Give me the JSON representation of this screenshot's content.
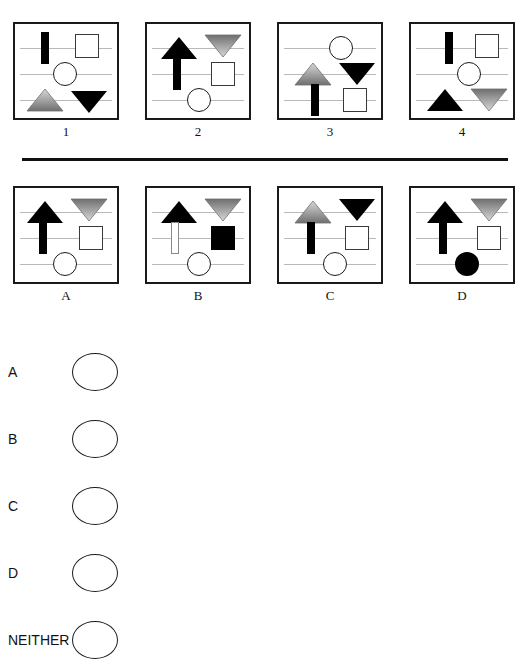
{
  "task": {
    "type": "visual-analogy-matrix",
    "divider_color": "#111111"
  },
  "palette": {
    "black": "#000000",
    "gray_light": "#d8d8d8",
    "gray_mid": "#9a9a9a",
    "gray_dark": "#6f6f6f",
    "rule_line": "#b9b9b9",
    "panel_border": "#1a1a1a",
    "background": "#ffffff"
  },
  "stimulus_row": {
    "panels": [
      {
        "label": "1",
        "shapes": [
          {
            "name": "bar-black",
            "kind": "bar",
            "fill": "black",
            "row": 1,
            "x": 30,
            "y": 24
          },
          {
            "name": "square-hollow",
            "kind": "square",
            "fill": "hollow",
            "row": 1,
            "x": 72,
            "y": 22
          },
          {
            "name": "circle-hollow",
            "kind": "circle",
            "fill": "hollow",
            "row": 2,
            "x": 50,
            "y": 50
          },
          {
            "name": "triangle-up-gray",
            "kind": "triangle-up",
            "fill": "gray",
            "row": 3,
            "x": 30,
            "y": 76
          },
          {
            "name": "triangle-down-black",
            "kind": "triangle-down",
            "fill": "black",
            "row": 3,
            "x": 74,
            "y": 78
          }
        ]
      },
      {
        "label": "2",
        "shapes": [
          {
            "name": "triangle-up-black",
            "kind": "triangle-up",
            "fill": "black",
            "row": 1,
            "x": 32,
            "y": 24
          },
          {
            "name": "triangle-down-gray",
            "kind": "triangle-down",
            "fill": "gray",
            "row": 1,
            "x": 76,
            "y": 22
          },
          {
            "name": "bar-black",
            "kind": "bar",
            "fill": "black",
            "row": 2,
            "x": 30,
            "y": 50
          },
          {
            "name": "square-hollow",
            "kind": "square",
            "fill": "hollow",
            "row": 2,
            "x": 76,
            "y": 50
          },
          {
            "name": "circle-hollow",
            "kind": "circle",
            "fill": "hollow",
            "row": 3,
            "x": 52,
            "y": 76
          }
        ]
      },
      {
        "label": "3",
        "shapes": [
          {
            "name": "circle-hollow",
            "kind": "circle",
            "fill": "hollow",
            "row": 1,
            "x": 62,
            "y": 24
          },
          {
            "name": "triangle-up-gray",
            "kind": "triangle-up",
            "fill": "gray",
            "row": 2,
            "x": 34,
            "y": 50
          },
          {
            "name": "triangle-down-black",
            "kind": "triangle-down",
            "fill": "black",
            "row": 2,
            "x": 78,
            "y": 50
          },
          {
            "name": "bar-black",
            "kind": "bar",
            "fill": "black",
            "row": 3,
            "x": 36,
            "y": 76
          },
          {
            "name": "square-hollow",
            "kind": "square",
            "fill": "hollow",
            "row": 3,
            "x": 76,
            "y": 76
          }
        ]
      },
      {
        "label": "4",
        "shapes": [
          {
            "name": "bar-black",
            "kind": "bar",
            "fill": "black",
            "row": 1,
            "x": 38,
            "y": 24
          },
          {
            "name": "square-hollow",
            "kind": "square",
            "fill": "hollow",
            "row": 1,
            "x": 76,
            "y": 22
          },
          {
            "name": "circle-hollow",
            "kind": "circle",
            "fill": "hollow",
            "row": 2,
            "x": 58,
            "y": 50
          },
          {
            "name": "triangle-up-black",
            "kind": "triangle-up",
            "fill": "black",
            "row": 3,
            "x": 34,
            "y": 76
          },
          {
            "name": "triangle-down-gray",
            "kind": "triangle-down",
            "fill": "gray",
            "row": 3,
            "x": 78,
            "y": 76
          }
        ]
      }
    ]
  },
  "choice_row": {
    "panels": [
      {
        "label": "A",
        "shapes": [
          {
            "name": "triangle-up-black",
            "kind": "triangle-up",
            "fill": "black",
            "row": 1,
            "x": 30,
            "y": 24
          },
          {
            "name": "triangle-down-gray",
            "kind": "triangle-down",
            "fill": "gray",
            "row": 1,
            "x": 74,
            "y": 22
          },
          {
            "name": "bar-black",
            "kind": "bar",
            "fill": "black",
            "row": 2,
            "x": 28,
            "y": 50
          },
          {
            "name": "square-hollow",
            "kind": "square",
            "fill": "hollow",
            "row": 2,
            "x": 76,
            "y": 50
          },
          {
            "name": "circle-hollow",
            "kind": "circle",
            "fill": "hollow",
            "row": 3,
            "x": 50,
            "y": 76
          }
        ]
      },
      {
        "label": "B",
        "shapes": [
          {
            "name": "triangle-up-black",
            "kind": "triangle-up",
            "fill": "black",
            "row": 1,
            "x": 32,
            "y": 24
          },
          {
            "name": "triangle-down-gray",
            "kind": "triangle-down",
            "fill": "gray",
            "row": 1,
            "x": 76,
            "y": 22
          },
          {
            "name": "bar-hollow",
            "kind": "bar",
            "fill": "hollow",
            "row": 2,
            "x": 28,
            "y": 50
          },
          {
            "name": "square-black",
            "kind": "square",
            "fill": "black",
            "row": 2,
            "x": 76,
            "y": 50
          },
          {
            "name": "circle-hollow",
            "kind": "circle",
            "fill": "hollow",
            "row": 3,
            "x": 52,
            "y": 76
          }
        ]
      },
      {
        "label": "C",
        "shapes": [
          {
            "name": "triangle-up-gray",
            "kind": "triangle-up",
            "fill": "gray",
            "row": 1,
            "x": 34,
            "y": 24
          },
          {
            "name": "triangle-down-black",
            "kind": "triangle-down",
            "fill": "black",
            "row": 1,
            "x": 78,
            "y": 22
          },
          {
            "name": "bar-black",
            "kind": "bar",
            "fill": "black",
            "row": 2,
            "x": 32,
            "y": 50
          },
          {
            "name": "square-hollow",
            "kind": "square",
            "fill": "hollow",
            "row": 2,
            "x": 78,
            "y": 50
          },
          {
            "name": "circle-hollow",
            "kind": "circle",
            "fill": "hollow",
            "row": 3,
            "x": 56,
            "y": 76
          }
        ]
      },
      {
        "label": "D",
        "shapes": [
          {
            "name": "triangle-up-black",
            "kind": "triangle-up",
            "fill": "black",
            "row": 1,
            "x": 34,
            "y": 24
          },
          {
            "name": "triangle-down-gray",
            "kind": "triangle-down",
            "fill": "gray",
            "row": 1,
            "x": 78,
            "y": 22
          },
          {
            "name": "bar-black",
            "kind": "bar",
            "fill": "black",
            "row": 2,
            "x": 32,
            "y": 50
          },
          {
            "name": "square-hollow",
            "kind": "square",
            "fill": "hollow",
            "row": 2,
            "x": 78,
            "y": 50
          },
          {
            "name": "circle-black",
            "kind": "circle",
            "fill": "black",
            "row": 3,
            "x": 56,
            "y": 76
          }
        ]
      }
    ]
  },
  "answer_options": [
    {
      "label": "A",
      "selected": false
    },
    {
      "label": "B",
      "selected": false
    },
    {
      "label": "C",
      "selected": false
    },
    {
      "label": "D",
      "selected": false
    },
    {
      "label": "NEITHER",
      "selected": false
    }
  ]
}
